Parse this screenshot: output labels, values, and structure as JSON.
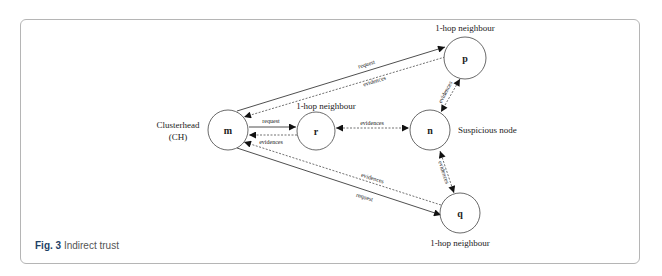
{
  "caption": {
    "figure_label": "Fig. 3",
    "title": "Indirect trust"
  },
  "nodes": {
    "m": {
      "id": "m",
      "label": "Clusterhead",
      "sublabel": "(CH)"
    },
    "r": {
      "id": "r",
      "label": "1-hop neighbour"
    },
    "n": {
      "id": "n",
      "label": "Suspicious node"
    },
    "p": {
      "id": "p",
      "label": "1-hop neighbour"
    },
    "q": {
      "id": "q",
      "label": "1-hop neighbour"
    }
  },
  "edges": {
    "m_r_request": "request",
    "r_m_evidences": "evidences",
    "r_n_evidences": "evidences",
    "m_p_request": "request",
    "p_m_evidences": "evidences",
    "p_n_evidences": "evidences",
    "n_q_evidences": "evidences",
    "q_m_evidences": "evidences",
    "m_q_request": "request"
  }
}
